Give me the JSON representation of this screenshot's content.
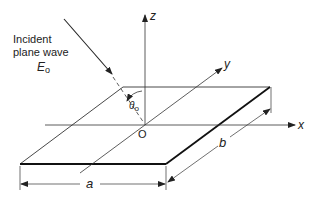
{
  "labels": {
    "incident_line1": "Incident",
    "incident_line2": "plane wave",
    "field_symbol": "E",
    "field_subscript": "o",
    "axis_x": "x",
    "axis_y": "y",
    "axis_z": "z",
    "origin": "O",
    "angle_symbol": "θ",
    "angle_subscript": "o",
    "dim_a": "a",
    "dim_b": "b"
  },
  "colors": {
    "ink": "#222222",
    "thin_line": "#333333",
    "background": "#ffffff"
  }
}
